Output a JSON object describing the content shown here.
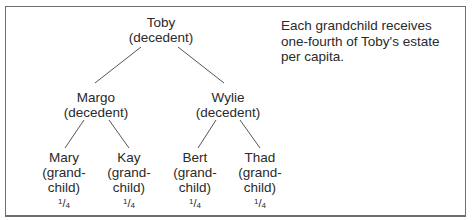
{
  "diagram": {
    "root": {
      "name": "Toby",
      "role": "(decedent)"
    },
    "children": [
      {
        "name": "Margo",
        "role": "(decedent)",
        "children": [
          {
            "name": "Mary",
            "role_line1": "(grand-",
            "role_line2": "child)",
            "share_num": "1",
            "share_den": "4"
          },
          {
            "name": "Kay",
            "role_line1": "(grand-",
            "role_line2": "child)",
            "share_num": "1",
            "share_den": "4"
          }
        ]
      },
      {
        "name": "Wylie",
        "role": "(decedent)",
        "children": [
          {
            "name": "Bert",
            "role_line1": "(grand-",
            "role_line2": "child)",
            "share_num": "1",
            "share_den": "4"
          },
          {
            "name": "Thad",
            "role_line1": "(grand-",
            "role_line2": "child)",
            "share_num": "1",
            "share_den": "4"
          }
        ]
      }
    ],
    "note": "Each grandchild receives one-fourth of Toby's estate per capita.",
    "colors": {
      "border": "#6e6e6e",
      "lines": "#555555",
      "text": "#2a2a2a"
    }
  }
}
